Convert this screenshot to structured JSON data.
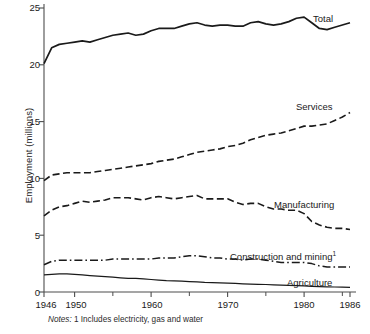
{
  "chart_data": {
    "type": "line",
    "title": "",
    "xlabel": "",
    "ylabel": "Employment (millions)",
    "xlim": [
      1946,
      1986
    ],
    "ylim": [
      0,
      25
    ],
    "grid": false,
    "legend_position": "inline-right",
    "x_ticks_major": [
      1946,
      1950,
      1960,
      1970,
      1980,
      1986
    ],
    "x_tick_labels": [
      "1946",
      "1950",
      "1960",
      "1970",
      "1980",
      "1986"
    ],
    "x_ticks_minor": [
      1955,
      1965,
      1975,
      1985
    ],
    "y_ticks": [
      0,
      5,
      10,
      15,
      20,
      25
    ],
    "y_tick_labels": [
      "0",
      "5",
      "10",
      "15",
      "20",
      "25"
    ],
    "x": [
      1946,
      1947,
      1948,
      1949,
      1950,
      1951,
      1952,
      1953,
      1954,
      1955,
      1956,
      1957,
      1958,
      1959,
      1960,
      1961,
      1962,
      1963,
      1964,
      1965,
      1966,
      1967,
      1968,
      1969,
      1970,
      1971,
      1972,
      1973,
      1974,
      1975,
      1976,
      1977,
      1978,
      1979,
      1980,
      1981,
      1982,
      1983,
      1984,
      1985,
      1986
    ],
    "series": [
      {
        "name": "Total",
        "style": "solid",
        "values": [
          20.1,
          21.5,
          21.8,
          21.9,
          22.0,
          22.1,
          22.0,
          22.2,
          22.4,
          22.6,
          22.7,
          22.8,
          22.6,
          22.7,
          23.0,
          23.2,
          23.2,
          23.2,
          23.4,
          23.6,
          23.7,
          23.5,
          23.4,
          23.5,
          23.5,
          23.4,
          23.4,
          23.7,
          23.8,
          23.6,
          23.5,
          23.6,
          23.8,
          24.1,
          24.2,
          23.7,
          23.2,
          23.1,
          23.3,
          23.5,
          23.7
        ]
      },
      {
        "name": "Services",
        "style": "dashed",
        "values": [
          9.8,
          10.3,
          10.4,
          10.5,
          10.5,
          10.5,
          10.5,
          10.6,
          10.7,
          10.8,
          10.9,
          11.0,
          11.1,
          11.2,
          11.3,
          11.5,
          11.6,
          11.7,
          11.9,
          12.1,
          12.3,
          12.4,
          12.5,
          12.6,
          12.8,
          12.9,
          13.1,
          13.4,
          13.6,
          13.8,
          13.9,
          14.0,
          14.2,
          14.4,
          14.6,
          14.6,
          14.7,
          14.8,
          15.1,
          15.4,
          15.8
        ]
      },
      {
        "name": "Manufacturing",
        "style": "dashed",
        "values": [
          6.7,
          7.2,
          7.5,
          7.6,
          7.8,
          8.0,
          7.9,
          8.0,
          8.1,
          8.3,
          8.3,
          8.3,
          8.2,
          8.1,
          8.3,
          8.4,
          8.3,
          8.2,
          8.3,
          8.4,
          8.5,
          8.2,
          8.2,
          8.2,
          8.2,
          7.9,
          7.7,
          7.8,
          7.8,
          7.5,
          7.3,
          7.3,
          7.2,
          7.2,
          6.9,
          6.2,
          5.9,
          5.7,
          5.6,
          5.6,
          5.5
        ]
      },
      {
        "name": "Construction and mining",
        "style": "dashdot",
        "footnote_marker": "1",
        "values": [
          2.4,
          2.7,
          2.8,
          2.8,
          2.8,
          2.8,
          2.8,
          2.8,
          2.8,
          2.9,
          2.9,
          2.9,
          2.9,
          2.9,
          2.9,
          3.0,
          3.0,
          3.0,
          3.1,
          3.2,
          3.2,
          3.1,
          3.0,
          3.0,
          2.9,
          2.9,
          2.8,
          2.9,
          2.9,
          2.8,
          2.7,
          2.6,
          2.6,
          2.6,
          2.6,
          2.5,
          2.3,
          2.2,
          2.2,
          2.2,
          2.2
        ]
      },
      {
        "name": "Agriculture",
        "style": "solid-thin",
        "values": [
          1.5,
          1.55,
          1.6,
          1.6,
          1.55,
          1.5,
          1.45,
          1.4,
          1.35,
          1.3,
          1.25,
          1.2,
          1.2,
          1.15,
          1.1,
          1.05,
          1.0,
          0.98,
          0.95,
          0.92,
          0.9,
          0.85,
          0.82,
          0.8,
          0.78,
          0.75,
          0.72,
          0.7,
          0.68,
          0.66,
          0.63,
          0.6,
          0.58,
          0.56,
          0.54,
          0.5,
          0.48,
          0.46,
          0.44,
          0.42,
          0.4
        ]
      }
    ],
    "annotations": {
      "notes_prefix": "Notes:",
      "notes_text": "1 Includes electricity, gas and water"
    }
  },
  "axis": {
    "y_label": "Employment (millions)",
    "y_ticks": [
      "25",
      "20",
      "15",
      "10",
      "5",
      "0"
    ],
    "x_ticks": [
      "1946",
      "1950",
      "1960",
      "1970",
      "1980",
      "1986"
    ]
  },
  "series_labels": {
    "total": "Total",
    "services": "Services",
    "manufacturing": "Manufacturing",
    "construction": "Construction and mining",
    "construction_marker": "1",
    "agriculture": "Agriculture"
  },
  "notes": {
    "prefix": "Notes:",
    "text": "1 Includes electricity, gas and water"
  },
  "colors": {
    "ink": "#1a1a1a",
    "axis": "#4d4d4d",
    "background": "#ffffff"
  }
}
